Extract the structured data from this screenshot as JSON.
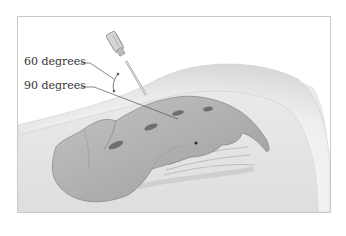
{
  "figure": {
    "type": "anatomical-illustration",
    "labels": [
      {
        "id": "angle-60",
        "text": "60 degrees"
      },
      {
        "id": "angle-90",
        "text": "90 degrees"
      }
    ]
  },
  "colors": {
    "background": "#ffffff",
    "frame_border": "#c9c9c9",
    "tissue": "#e4e4e4",
    "skin_highlight": "#f4f4f4",
    "bone": "#b3b3b3",
    "bone_shadow": "#8f8f8f",
    "foramen": "#6f6f6f",
    "label_text": "#333333",
    "leader_line": "#555555"
  }
}
